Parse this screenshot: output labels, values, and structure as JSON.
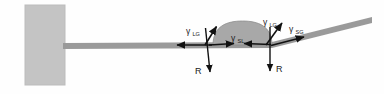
{
  "figure": {
    "background_color": "#fefefe"
  },
  "wall": {
    "name": "fixed-support-wall",
    "fill_color": "#c4c4c4",
    "stroke_color": "#b0b0b0",
    "x": 25,
    "y": 5,
    "width": 40,
    "height": 80
  },
  "beam": {
    "name": "cantilever-beam",
    "fill_color": "#9a9a9a",
    "thickness": 6,
    "root_x": 63,
    "root_y": 46,
    "bend_x": 272,
    "bend_y": 45,
    "tip_x": 372,
    "tip_y": 20
  },
  "droplet": {
    "name": "liquid-droplet",
    "fill_color": "#a8a8a8",
    "stroke_color": "#8a8a8a",
    "left_contact_x": 213,
    "right_contact_x": 272,
    "baseline_y": 44,
    "apex_y": 23
  },
  "labels": {
    "gamma": "γ",
    "gamma_lg_left": {
      "symbol": "γ",
      "subscript": "LG",
      "x": 188,
      "y": 33
    },
    "gamma_lg_right": {
      "symbol": "γ",
      "subscript": "LG",
      "x": 264,
      "y": 25
    },
    "gamma_sl": {
      "symbol": "γ",
      "subscript": "SL",
      "x": 232,
      "y": 43
    },
    "gamma_sg": {
      "symbol": "γ",
      "subscript": "SG",
      "x": 290,
      "y": 32
    },
    "reaction_left": {
      "text": "R",
      "x": 198,
      "y": 73
    },
    "reaction_right": {
      "text": "R",
      "x": 277,
      "y": 71
    }
  },
  "arrows": {
    "color": "#111111",
    "stroke_width": 1.6,
    "items": [
      {
        "name": "arrow-gamma-lg-left",
        "label": "γLG",
        "description": "liquid-gas surface tension at left contact line, tangent to droplet, pointing up-right",
        "x1": 205,
        "y1": 45,
        "x2": 216,
        "y2": 26
      },
      {
        "name": "arrow-gamma-lg-right",
        "label": "γLG",
        "description": "liquid-gas surface tension at right contact line, tangent to droplet, pointing up-right",
        "x1": 267,
        "y1": 45,
        "x2": 282,
        "y2": 23
      },
      {
        "name": "arrow-gamma-sl-left",
        "label": "γSL",
        "description": "solid-liquid interfacial tension pulling inward from left contact line",
        "x1": 209,
        "y1": 45,
        "x2": 235,
        "y2": 43
      },
      {
        "name": "arrow-gamma-sl-right",
        "label": "γSL",
        "description": "solid-liquid interfacial tension pulling inward from right contact line",
        "x1": 271,
        "y1": 44,
        "x2": 243,
        "y2": 43
      },
      {
        "name": "arrow-gamma-sg-left",
        "label": "",
        "description": "solid-gas tension pulling left along beam from left contact line",
        "x1": 211,
        "y1": 45,
        "x2": 177,
        "y2": 45
      },
      {
        "name": "arrow-gamma-sg-right",
        "label": "γSG",
        "description": "solid-gas tension pulling right along bent beam from right contact line",
        "x1": 272,
        "y1": 45,
        "x2": 304,
        "y2": 37
      },
      {
        "name": "arrow-reaction-left",
        "label": "R",
        "description": "downward reaction force at left contact line",
        "x1": 206,
        "y1": 27,
        "x2": 210,
        "y2": 73
      },
      {
        "name": "arrow-reaction-right",
        "label": "R",
        "description": "downward reaction force at right contact line",
        "x1": 270,
        "y1": 26,
        "x2": 270,
        "y2": 72
      }
    ]
  }
}
